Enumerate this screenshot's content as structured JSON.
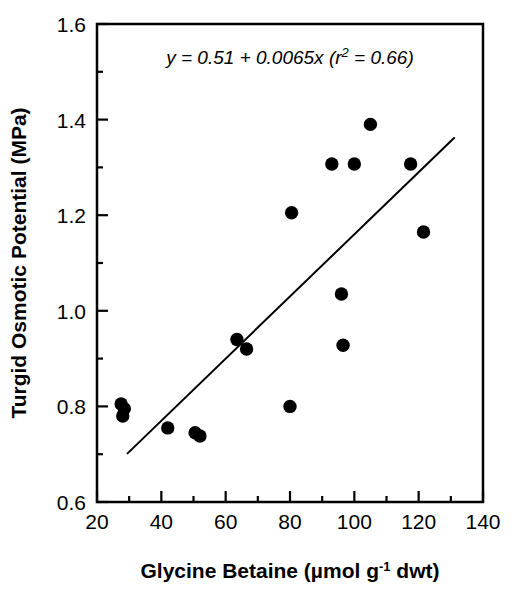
{
  "chart_data": {
    "type": "scatter",
    "title": "",
    "xlabel": "Glycine Betaine (µmol g⁻¹ dwt)",
    "ylabel": "Turgid Osmotic Potential (MPa)",
    "xlim": [
      20,
      140
    ],
    "ylim": [
      0.6,
      1.6
    ],
    "xticks": [
      20,
      40,
      60,
      80,
      100,
      120,
      140
    ],
    "xtick_labels": [
      "20",
      "40",
      "60",
      "80",
      "100",
      "120",
      "140"
    ],
    "x_minor_ticks": [
      30,
      50,
      70,
      90,
      110,
      130
    ],
    "yticks": [
      0.6,
      0.8,
      1.0,
      1.2,
      1.4,
      1.6
    ],
    "ytick_labels": [
      "0.6",
      "0.8",
      "1.0",
      "1.2",
      "1.4",
      "1.6"
    ],
    "y_minor_ticks": [
      0.7,
      0.9,
      1.1,
      1.3,
      1.5
    ],
    "grid": false,
    "legend": null,
    "annotation": "y = 0.51 + 0.0065x (r² = 0.66)",
    "annotation_parts": {
      "main": "y = 0.51 + 0.0065x (r",
      "superscript": "2",
      "tail": " = 0.66)"
    },
    "marker": {
      "shape": "circle",
      "color": "#000000",
      "size": 9
    },
    "points": [
      {
        "x": 27.5,
        "y": 0.805
      },
      {
        "x": 28.5,
        "y": 0.795
      },
      {
        "x": 28.0,
        "y": 0.78
      },
      {
        "x": 42.0,
        "y": 0.755
      },
      {
        "x": 50.5,
        "y": 0.745
      },
      {
        "x": 52.0,
        "y": 0.738
      },
      {
        "x": 63.5,
        "y": 0.94
      },
      {
        "x": 66.5,
        "y": 0.92
      },
      {
        "x": 80.0,
        "y": 0.8
      },
      {
        "x": 80.5,
        "y": 1.205
      },
      {
        "x": 93.0,
        "y": 1.307
      },
      {
        "x": 96.0,
        "y": 1.035
      },
      {
        "x": 96.5,
        "y": 0.928
      },
      {
        "x": 100.0,
        "y": 1.307
      },
      {
        "x": 105.0,
        "y": 1.39
      },
      {
        "x": 117.5,
        "y": 1.307
      },
      {
        "x": 121.5,
        "y": 1.165
      }
    ],
    "fit_line": {
      "intercept": 0.51,
      "slope": 0.0065,
      "r_squared": 0.66,
      "x_start": 29.5,
      "x_end": 131.0,
      "color": "#000000",
      "width": 2
    },
    "axis_color": "#000000",
    "background": "#ffffff"
  }
}
